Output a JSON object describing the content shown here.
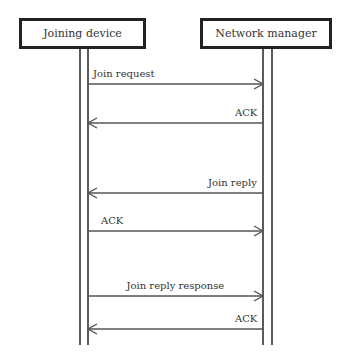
{
  "participants": [
    {
      "id": "joining-device",
      "label": "Joining device"
    },
    {
      "id": "network-manager",
      "label": "Network manager"
    }
  ],
  "messages": [
    {
      "label": "Join request",
      "from": "joining-device",
      "to": "network-manager",
      "label_align": "left"
    },
    {
      "label": "ACK",
      "from": "network-manager",
      "to": "joining-device",
      "label_align": "right"
    },
    {
      "label": "Join reply",
      "from": "network-manager",
      "to": "joining-device",
      "label_align": "right"
    },
    {
      "label": "ACK",
      "from": "joining-device",
      "to": "network-manager",
      "label_align": "left"
    },
    {
      "label": "Join reply response",
      "from": "joining-device",
      "to": "network-manager",
      "label_align": "center"
    },
    {
      "label": "ACK",
      "from": "network-manager",
      "to": "joining-device",
      "label_align": "right"
    }
  ],
  "colors": {
    "line": "#555555",
    "box_border": "#222222",
    "text": "#333333"
  }
}
